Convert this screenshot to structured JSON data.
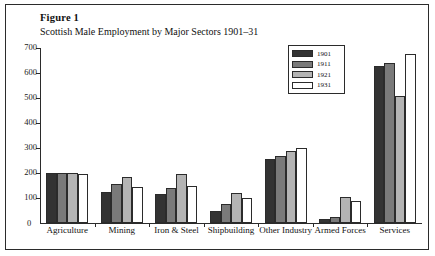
{
  "figure": {
    "label": "Figure 1",
    "subtitle": "Scottish Male Employment by Major Sectors 1901–31",
    "zero_label": "0"
  },
  "chart_data": {
    "type": "bar",
    "title": "Scottish Male Employment by Major Sectors 1901–31",
    "xlabel": "",
    "ylabel": "",
    "ylim": [
      0,
      700
    ],
    "yticks": [
      100,
      200,
      300,
      400,
      500,
      600,
      700
    ],
    "ytick_labels": [
      "100",
      "200",
      "300",
      "400",
      "500",
      "600",
      "700"
    ],
    "grid": false,
    "legend_position": "top-right",
    "categories": [
      "Agriculture",
      "Mining",
      "Iron & Steel",
      "Shipbuilding",
      "Other Industry",
      "Armed Forces",
      "Services"
    ],
    "series": [
      {
        "name": "1901",
        "color": "#333333",
        "values": [
          200,
          125,
          115,
          50,
          255,
          15,
          630
        ]
      },
      {
        "name": "1911",
        "color": "#7a7a7a",
        "values": [
          200,
          155,
          140,
          75,
          270,
          25,
          640
        ]
      },
      {
        "name": "1921",
        "color": "#b4b4b4",
        "values": [
          200,
          185,
          195,
          120,
          290,
          105,
          510
        ]
      },
      {
        "name": "1931",
        "color": "#ffffff",
        "values": [
          197,
          145,
          150,
          100,
          300,
          90,
          675
        ]
      }
    ]
  },
  "colors": {
    "ink": "#2b2b2b",
    "paper": "#ffffff"
  }
}
